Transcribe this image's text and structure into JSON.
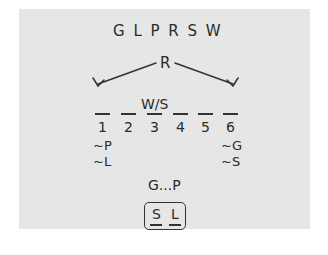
{
  "variables": "G L P R S W",
  "root_label": "R",
  "slot_annotation": "W/S",
  "slots": [
    "1",
    "2",
    "3",
    "4",
    "5",
    "6"
  ],
  "left_constraints": [
    "~P",
    "~L"
  ],
  "right_constraints": [
    "~G",
    "~S"
  ],
  "sequence_rule": "G...P",
  "boxed_pair": [
    "S",
    "L"
  ]
}
